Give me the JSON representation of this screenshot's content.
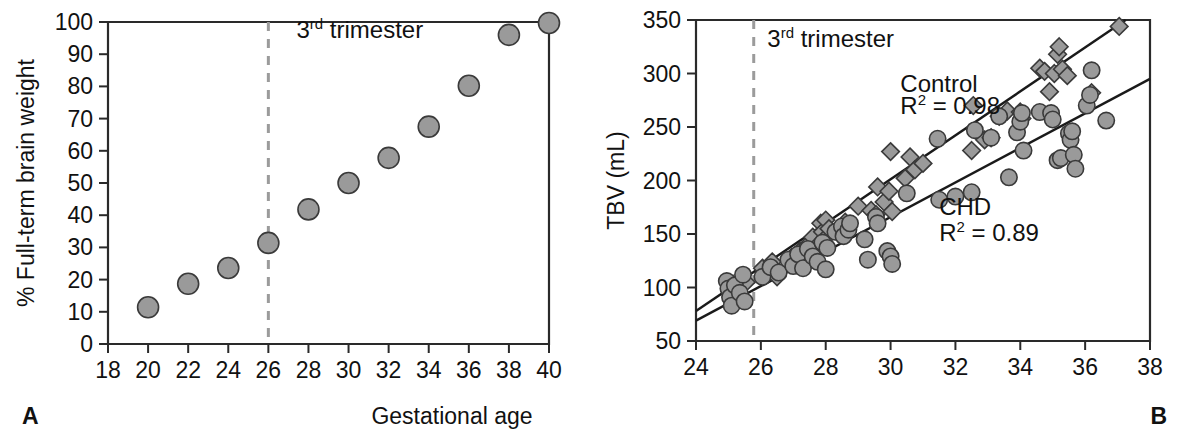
{
  "figure": {
    "shared_xlabel": "Gestational age",
    "panel_a_letter": "A",
    "panel_b_letter": "B"
  },
  "chart_data": [
    {
      "id": "panel-a",
      "type": "scatter",
      "title": "",
      "panel_letter": "A",
      "xlabel": "Gestational age",
      "ylabel": "% Full-term brain weight",
      "xlim": [
        18,
        40
      ],
      "ylim": [
        0,
        100
      ],
      "xticks": [
        18,
        20,
        22,
        24,
        26,
        28,
        30,
        32,
        34,
        36,
        38,
        40
      ],
      "xticklabels": [
        "18",
        "20",
        "22",
        "24",
        "26",
        "28",
        "30",
        "32",
        "34",
        "36",
        "38",
        "40"
      ],
      "yticks": [
        0,
        10,
        20,
        30,
        40,
        50,
        60,
        70,
        80,
        90,
        100
      ],
      "yticklabels": [
        "0",
        "10",
        "20",
        "30",
        "40",
        "50",
        "60",
        "70",
        "80",
        "90",
        "100"
      ],
      "grid": false,
      "legend": "none",
      "annotations": [
        {
          "name": "trimester-label",
          "text_before": "3",
          "text_super": "rd",
          "text_after": " trimester",
          "x": 27.4,
          "y": 95
        }
      ],
      "vline": {
        "x": 26,
        "style": "dashed",
        "color": "#9b9b9b"
      },
      "series": [
        {
          "name": "Full-term brain weight",
          "marker": "circle",
          "color": "#9a9a9a",
          "x": [
            20,
            22,
            24,
            26,
            28,
            30,
            32,
            34,
            36,
            38,
            40
          ],
          "y": [
            11.4,
            18.7,
            23.6,
            31.4,
            41.8,
            50.0,
            57.8,
            67.5,
            80.2,
            96.0,
            99.7
          ]
        }
      ]
    },
    {
      "id": "panel-b",
      "type": "scatter",
      "title": "",
      "panel_letter": "B",
      "xlabel": "Gestational age",
      "ylabel": "TBV (mL)",
      "xlim": [
        24,
        38
      ],
      "ylim": [
        50,
        350
      ],
      "xticks": [
        24,
        26,
        28,
        30,
        32,
        34,
        36,
        38
      ],
      "xticklabels": [
        "24",
        "26",
        "28",
        "30",
        "32",
        "34",
        "36",
        "38"
      ],
      "yticks": [
        50,
        100,
        150,
        200,
        250,
        300,
        350
      ],
      "yticklabels": [
        "50",
        "100",
        "150",
        "200",
        "250",
        "300",
        "350"
      ],
      "grid": false,
      "legend": "inline-labels",
      "annotations": [
        {
          "name": "trimester-label",
          "text_before": "3",
          "text_super": "rd",
          "text_after": " trimester",
          "x": 26.2,
          "y": 325
        },
        {
          "name": "control-label",
          "text": "Control",
          "x": 30.3,
          "y": 283
        },
        {
          "name": "control-r2",
          "text_before": "R",
          "text_super": "2",
          "text_after": " = 0.98",
          "x": 30.3,
          "y": 262
        },
        {
          "name": "chd-label",
          "text": "CHD",
          "x": 31.5,
          "y": 168
        },
        {
          "name": "chd-r2",
          "text_before": "R",
          "text_super": "2",
          "text_after": " = 0.89",
          "x": 31.5,
          "y": 143
        }
      ],
      "vline": {
        "x": 25.78,
        "style": "dashed",
        "color": "#9b9b9b"
      },
      "fit_lines": [
        {
          "name": "Control",
          "r2": 0.98,
          "x0": 24.0,
          "y0": 78,
          "x1": 37.25,
          "y1": 350
        },
        {
          "name": "CHD",
          "r2": 0.89,
          "x0": 24.0,
          "y0": 69,
          "x1": 38.0,
          "y1": 295
        }
      ],
      "series": [
        {
          "name": "Control",
          "marker": "diamond",
          "color": "#9a9a9a",
          "points": [
            [
              25.15,
              103
            ],
            [
              25.3,
              96
            ],
            [
              25.45,
              88
            ],
            [
              25.55,
              105
            ],
            [
              26.05,
              118
            ],
            [
              26.2,
              113
            ],
            [
              26.35,
              124
            ],
            [
              26.5,
              110
            ],
            [
              26.95,
              128
            ],
            [
              27.1,
              122
            ],
            [
              27.2,
              134
            ],
            [
              27.3,
              127
            ],
            [
              27.45,
              140
            ],
            [
              27.5,
              133
            ],
            [
              27.6,
              147
            ],
            [
              27.7,
              138
            ],
            [
              27.85,
              160
            ],
            [
              27.9,
              152
            ],
            [
              27.95,
              145
            ],
            [
              28.0,
              163
            ],
            [
              28.1,
              155
            ],
            [
              28.45,
              156
            ],
            [
              28.55,
              150
            ],
            [
              28.6,
              161
            ],
            [
              29.0,
              176
            ],
            [
              29.4,
              172
            ],
            [
              29.55,
              168
            ],
            [
              29.6,
              194
            ],
            [
              29.8,
              180
            ],
            [
              29.95,
              190
            ],
            [
              30.05,
              171
            ],
            [
              30.0,
              227
            ],
            [
              30.45,
              202
            ],
            [
              30.6,
              222
            ],
            [
              30.75,
              210
            ],
            [
              31.0,
              216
            ],
            [
              32.5,
              228
            ],
            [
              32.55,
              270
            ],
            [
              32.9,
              238
            ],
            [
              33.1,
              240
            ],
            [
              33.35,
              260
            ],
            [
              33.6,
              265
            ],
            [
              34.0,
              264
            ],
            [
              34.05,
              258
            ],
            [
              34.6,
              305
            ],
            [
              34.75,
              302
            ],
            [
              34.9,
              283
            ],
            [
              35.05,
              300
            ],
            [
              35.15,
              318
            ],
            [
              35.2,
              325
            ],
            [
              35.3,
              304
            ],
            [
              35.45,
              298
            ],
            [
              36.2,
              282
            ],
            [
              37.05,
              344
            ]
          ]
        },
        {
          "name": "CHD",
          "marker": "circle",
          "color": "#9a9a9a",
          "points": [
            [
              24.95,
              106
            ],
            [
              25.0,
              99
            ],
            [
              25.05,
              91
            ],
            [
              25.1,
              83
            ],
            [
              25.2,
              102
            ],
            [
              25.35,
              95
            ],
            [
              25.45,
              112
            ],
            [
              25.5,
              87
            ],
            [
              26.05,
              110
            ],
            [
              26.3,
              119
            ],
            [
              26.55,
              114
            ],
            [
              26.85,
              126
            ],
            [
              27.0,
              120
            ],
            [
              27.15,
              131
            ],
            [
              27.3,
              118
            ],
            [
              27.45,
              136
            ],
            [
              27.6,
              129
            ],
            [
              27.75,
              124
            ],
            [
              27.9,
              142
            ],
            [
              28.0,
              117
            ],
            [
              28.05,
              137
            ],
            [
              28.3,
              152
            ],
            [
              28.5,
              157
            ],
            [
              28.55,
              148
            ],
            [
              28.7,
              154
            ],
            [
              28.75,
              160
            ],
            [
              29.2,
              145
            ],
            [
              29.3,
              126
            ],
            [
              29.55,
              166
            ],
            [
              29.6,
              160
            ],
            [
              29.9,
              134
            ],
            [
              30.0,
              129
            ],
            [
              30.05,
              122
            ],
            [
              30.5,
              188
            ],
            [
              31.5,
              182
            ],
            [
              31.45,
              239
            ],
            [
              32.0,
              185
            ],
            [
              32.5,
              189
            ],
            [
              32.6,
              247
            ],
            [
              33.1,
              240
            ],
            [
              33.35,
              260
            ],
            [
              33.65,
              203
            ],
            [
              33.9,
              245
            ],
            [
              34.0,
              255
            ],
            [
              34.05,
              263
            ],
            [
              34.1,
              228
            ],
            [
              34.6,
              264
            ],
            [
              34.95,
              263
            ],
            [
              35.0,
              257
            ],
            [
              35.15,
              219
            ],
            [
              35.25,
              221
            ],
            [
              35.5,
              244
            ],
            [
              35.55,
              238
            ],
            [
              35.6,
              246
            ],
            [
              35.65,
              224
            ],
            [
              35.7,
              211
            ],
            [
              36.05,
              270
            ],
            [
              36.15,
              280
            ],
            [
              36.2,
              303
            ],
            [
              36.65,
              256
            ]
          ]
        }
      ]
    }
  ]
}
